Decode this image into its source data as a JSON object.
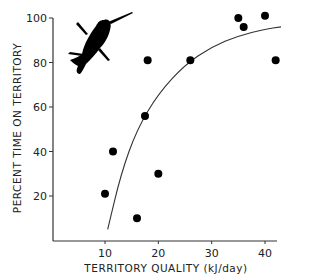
{
  "chart_data": {
    "type": "scatter",
    "title": "",
    "xlabel": "TERRITORY QUALITY (kJ/day)",
    "ylabel": "PERCENT TIME ON TERRITORY",
    "xlim": [
      0,
      43
    ],
    "ylim": [
      0,
      100
    ],
    "x_ticks": [
      "10",
      "20",
      "30",
      "40"
    ],
    "y_ticks": [
      "20",
      "40",
      "60",
      "80",
      "100"
    ],
    "grid": false,
    "legend": null,
    "series": [
      {
        "name": "observations",
        "kind": "scatter",
        "points": [
          {
            "x": 10,
            "y": 21
          },
          {
            "x": 11.5,
            "y": 40
          },
          {
            "x": 16,
            "y": 10
          },
          {
            "x": 17.5,
            "y": 56
          },
          {
            "x": 18,
            "y": 81
          },
          {
            "x": 20,
            "y": 30
          },
          {
            "x": 26,
            "y": 81
          },
          {
            "x": 35,
            "y": 100
          },
          {
            "x": 36,
            "y": 96
          },
          {
            "x": 40,
            "y": 101
          },
          {
            "x": 42,
            "y": 81
          }
        ]
      },
      {
        "name": "fitted curve",
        "kind": "line",
        "points": [
          {
            "x": 10.5,
            "y": 5
          },
          {
            "x": 13,
            "y": 30
          },
          {
            "x": 16,
            "y": 50
          },
          {
            "x": 20,
            "y": 66
          },
          {
            "x": 25,
            "y": 79
          },
          {
            "x": 30,
            "y": 87
          },
          {
            "x": 35,
            "y": 92
          },
          {
            "x": 40,
            "y": 95
          },
          {
            "x": 43,
            "y": 96
          }
        ]
      }
    ],
    "annotations": [
      "hummingbird silhouette (upper left)"
    ]
  }
}
